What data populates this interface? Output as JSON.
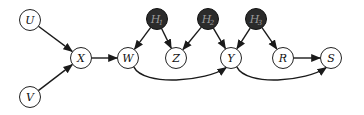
{
  "diagram": {
    "type": "causal-dag",
    "colors": {
      "observed_fill": "#ffffff",
      "observed_stroke": "#222222",
      "hidden_fill": "#2b2b2b",
      "hidden_stroke": "#111111",
      "edge": "#1a1a1a",
      "label_dark": "#111111",
      "label_light": "#9a9a9a"
    },
    "nodes": [
      {
        "id": "U",
        "label": "U",
        "sub": "",
        "hidden": false,
        "x": 30,
        "y": 20
      },
      {
        "id": "V",
        "label": "V",
        "sub": "",
        "hidden": false,
        "x": 30,
        "y": 97
      },
      {
        "id": "X",
        "label": "X",
        "sub": "",
        "hidden": false,
        "x": 81,
        "y": 58
      },
      {
        "id": "W",
        "label": "W",
        "sub": "",
        "hidden": false,
        "x": 128,
        "y": 58
      },
      {
        "id": "Z",
        "label": "Z",
        "sub": "",
        "hidden": false,
        "x": 176,
        "y": 58
      },
      {
        "id": "Y",
        "label": "Y",
        "sub": "",
        "hidden": false,
        "x": 231,
        "y": 58
      },
      {
        "id": "R",
        "label": "R",
        "sub": "",
        "hidden": false,
        "x": 283,
        "y": 58
      },
      {
        "id": "S",
        "label": "S",
        "sub": "",
        "hidden": false,
        "x": 331,
        "y": 58
      },
      {
        "id": "H1",
        "label": "H",
        "sub": "1",
        "hidden": true,
        "x": 157,
        "y": 19
      },
      {
        "id": "H2",
        "label": "H",
        "sub": "2",
        "hidden": true,
        "x": 208,
        "y": 19
      },
      {
        "id": "H3",
        "label": "H",
        "sub": "3",
        "hidden": true,
        "x": 256,
        "y": 19
      }
    ],
    "edges": [
      {
        "from": "U",
        "to": "X",
        "curve": "straight"
      },
      {
        "from": "V",
        "to": "X",
        "curve": "straight"
      },
      {
        "from": "X",
        "to": "W",
        "curve": "straight"
      },
      {
        "from": "H1",
        "to": "W",
        "curve": "straight"
      },
      {
        "from": "H1",
        "to": "Z",
        "curve": "straight"
      },
      {
        "from": "H2",
        "to": "Z",
        "curve": "straight"
      },
      {
        "from": "H2",
        "to": "Y",
        "curve": "straight"
      },
      {
        "from": "H3",
        "to": "Y",
        "curve": "straight"
      },
      {
        "from": "H3",
        "to": "R",
        "curve": "straight"
      },
      {
        "from": "R",
        "to": "S",
        "curve": "straight"
      },
      {
        "from": "W",
        "to": "Y",
        "curve": "below"
      },
      {
        "from": "Y",
        "to": "S",
        "curve": "below"
      }
    ],
    "node_radius": 10.5
  }
}
